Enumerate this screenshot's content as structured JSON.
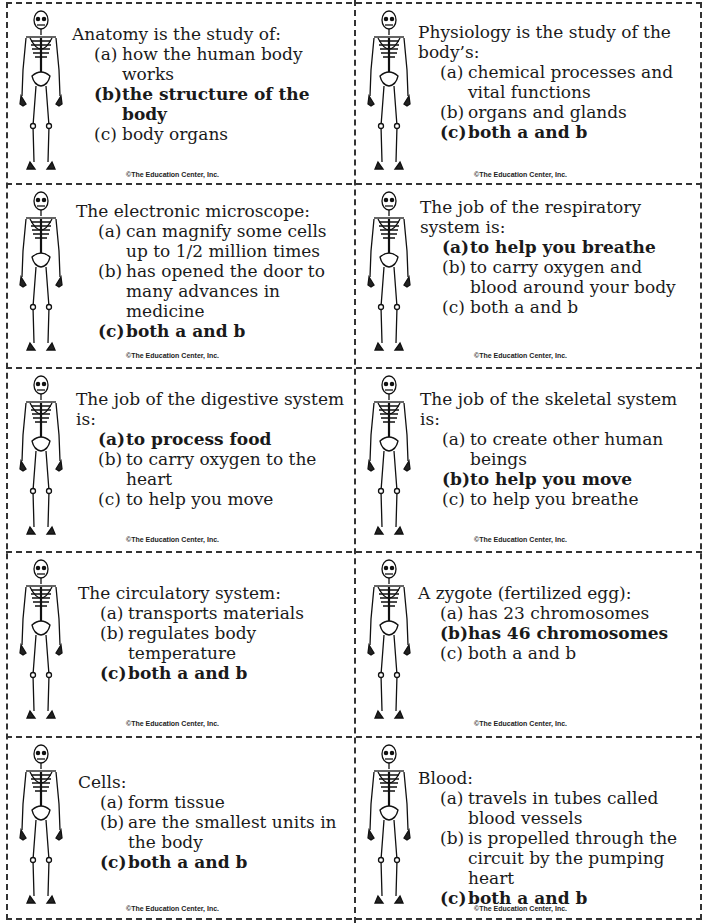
{
  "copyright": "©The Education Center, Inc.",
  "cards": [
    {
      "question": "Anatomy is the study of:",
      "options": [
        {
          "label": "(a)",
          "text": "how the human body works",
          "correct": false
        },
        {
          "label": "(b)",
          "text": "the structure of the body",
          "correct": true
        },
        {
          "label": "(c)",
          "text": "body organs",
          "correct": false
        }
      ]
    },
    {
      "question": "Physiology is the study of the body’s:",
      "options": [
        {
          "label": "(a)",
          "text": "chemical processes and vital functions",
          "correct": false
        },
        {
          "label": "(b)",
          "text": "organs and glands",
          "correct": false
        },
        {
          "label": "(c)",
          "text": "both a and b",
          "correct": true
        }
      ]
    },
    {
      "question": "The electronic microscope:",
      "options": [
        {
          "label": "(a)",
          "text": "can magnify some cells up to 1/2 million times",
          "correct": false
        },
        {
          "label": "(b)",
          "text": "has opened the door to many advances in medicine",
          "correct": false
        },
        {
          "label": "(c)",
          "text": "both a and b",
          "correct": true
        }
      ]
    },
    {
      "question": "The job of the respiratory system is:",
      "options": [
        {
          "label": "(a)",
          "text": "to help you breathe",
          "correct": true
        },
        {
          "label": "(b)",
          "text": "to carry oxygen and blood around your body",
          "correct": false
        },
        {
          "label": "(c)",
          "text": "both a and b",
          "correct": false
        }
      ]
    },
    {
      "question": "The job of the digestive system is:",
      "options": [
        {
          "label": "(a)",
          "text": "to process food",
          "correct": true
        },
        {
          "label": "(b)",
          "text": "to carry oxygen to the heart",
          "correct": false
        },
        {
          "label": "(c)",
          "text": "to help you move",
          "correct": false
        }
      ]
    },
    {
      "question": "The job of the skeletal system is:",
      "options": [
        {
          "label": "(a)",
          "text": "to create other human beings",
          "correct": false
        },
        {
          "label": "(b)",
          "text": "to help you move",
          "correct": true
        },
        {
          "label": "(c)",
          "text": "to help you breathe",
          "correct": false
        }
      ]
    },
    {
      "question": "The circulatory system:",
      "options": [
        {
          "label": "(a)",
          "text": "transports materials",
          "correct": false
        },
        {
          "label": "(b)",
          "text": "regulates body temperature",
          "correct": false
        },
        {
          "label": "(c)",
          "text": "both a and b",
          "correct": true
        }
      ]
    },
    {
      "question": "A zygote (fertilized egg):",
      "options": [
        {
          "label": "(a)",
          "text": "has 23 chromosomes",
          "correct": false
        },
        {
          "label": "(b)",
          "text": "has 46 chromosomes",
          "correct": true
        },
        {
          "label": "(c)",
          "text": "both a and b",
          "correct": false
        }
      ]
    },
    {
      "question": "Cells:",
      "options": [
        {
          "label": "(a)",
          "text": "form tissue",
          "correct": false
        },
        {
          "label": "(b)",
          "text": "are the smallest units in the body",
          "correct": false
        },
        {
          "label": "(c)",
          "text": "both a and b",
          "correct": true
        }
      ]
    },
    {
      "question": "Blood:",
      "options": [
        {
          "label": "(a)",
          "text": "travels in tubes called blood vessels",
          "correct": false
        },
        {
          "label": "(b)",
          "text": "is propelled through the circuit by the pumping heart",
          "correct": false
        },
        {
          "label": "(c)",
          "text": "both a and b",
          "correct": true
        }
      ]
    }
  ]
}
